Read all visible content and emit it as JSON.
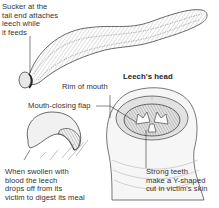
{
  "figure": {
    "type": "labeled illustration",
    "subject": "leech",
    "colors": {
      "ink": "#333333",
      "shade": "#9a9a9a",
      "background": "#ffffff"
    }
  },
  "labels": {
    "sucker": "Sucker at the\ntail end attaches\nleech while\nit feeds",
    "rim": "Rim of mouth",
    "head_title": "Leech's head",
    "flap": "Mouth-closing flap",
    "swollen": "When swollen with\nblood the leech\ndrops off from its\nvictim to digest its meal",
    "teeth": "Strong teeth\nmake a Y-shaped\ncut in victim's skin"
  }
}
